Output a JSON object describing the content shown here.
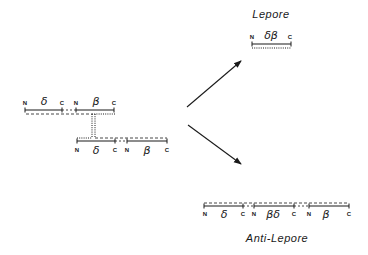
{
  "diagram": {
    "type": "unequal-crossover",
    "parent_top": {
      "labels": {
        "n1": "N",
        "gene1": "δ",
        "c1": "C",
        "n2": "N",
        "gene2": "β",
        "c2": "C"
      }
    },
    "parent_bottom": {
      "labels": {
        "n1": "N",
        "gene1": "δ",
        "c1": "C",
        "n2": "N",
        "gene2": "β",
        "c2": "C"
      }
    },
    "lepore": {
      "title": "Lepore",
      "labels": {
        "n": "N",
        "gene": "δβ",
        "c": "C"
      }
    },
    "anti_lepore": {
      "title": "Anti-Lepore",
      "labels": {
        "n1": "N",
        "gene1": "δ",
        "c1": "C",
        "n2": "N",
        "gene2": "βδ",
        "c2": "C",
        "n3": "N",
        "gene3": "β",
        "c3": "C"
      }
    },
    "arrows": [
      "to-lepore",
      "to-anti-lepore"
    ],
    "line_color": "#1a1a1a"
  }
}
